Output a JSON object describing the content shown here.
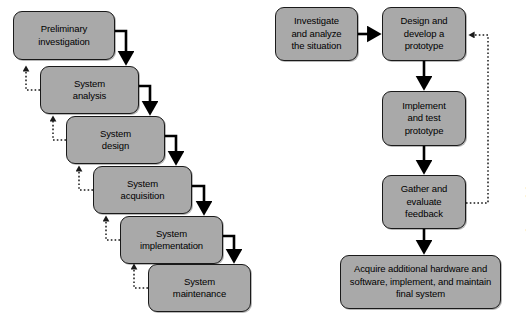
{
  "figure": {
    "credit": "© Cengage Learning",
    "background_color": "#ffffff",
    "node_fill_color": "#a9a9a9",
    "node_border_color": "#1a1a1a",
    "solid_arrow_color": "#000000",
    "dashed_arrow_color": "#3a3a3a"
  },
  "diagrams": [
    {
      "id": "waterfall",
      "name": "traditional-systems-development-life-cycle",
      "nodes": [
        {
          "id": "w1",
          "label": "Preliminary\ninvestigation",
          "line1": "Preliminary",
          "line2": "investigation",
          "x": 13,
          "y": 11,
          "w": 102,
          "h": 49
        },
        {
          "id": "w2",
          "label": "System\nanalysis",
          "line1": "System",
          "line2": "analysis",
          "x": 40,
          "y": 66,
          "w": 99,
          "h": 48
        },
        {
          "id": "w3",
          "label": "System\ndesign",
          "line1": "System",
          "line2": "design",
          "x": 66,
          "y": 116,
          "w": 99,
          "h": 48
        },
        {
          "id": "w4",
          "label": "System\nacquisition",
          "line1": "System",
          "line2": "acquisition",
          "x": 93,
          "y": 166,
          "w": 99,
          "h": 48
        },
        {
          "id": "w5",
          "label": "System\nimplementation",
          "line1": "System",
          "line2": "implementation",
          "x": 120,
          "y": 216,
          "w": 103,
          "h": 48
        },
        {
          "id": "w6",
          "label": "System\nmaintenance",
          "line1": "System",
          "line2": "maintenance",
          "x": 148,
          "y": 264,
          "w": 103,
          "h": 48
        }
      ],
      "forward_arrows": [
        {
          "from": "w1",
          "to": "w2",
          "style": "solid"
        },
        {
          "from": "w2",
          "to": "w3",
          "style": "solid"
        },
        {
          "from": "w3",
          "to": "w4",
          "style": "solid"
        },
        {
          "from": "w4",
          "to": "w5",
          "style": "solid"
        },
        {
          "from": "w5",
          "to": "w6",
          "style": "solid"
        }
      ],
      "feedback_arrows": [
        {
          "from": "w2",
          "to": "w1",
          "style": "dashed"
        },
        {
          "from": "w3",
          "to": "w2",
          "style": "dashed"
        },
        {
          "from": "w4",
          "to": "w3",
          "style": "dashed"
        },
        {
          "from": "w5",
          "to": "w4",
          "style": "dashed"
        },
        {
          "from": "w6",
          "to": "w5",
          "style": "dashed"
        }
      ]
    },
    {
      "id": "prototyping",
      "name": "prototyping-development-process",
      "nodes": [
        {
          "id": "p1",
          "label": "Investigate and analyze the situation",
          "line1": "Investigate",
          "line2": "and analyze",
          "line3": "the situation",
          "x": 275,
          "y": 7,
          "w": 83,
          "h": 54
        },
        {
          "id": "p2",
          "label": "Design and develop a prototype",
          "line1": "Design and",
          "line2": "develop a",
          "line3": "prototype",
          "x": 382,
          "y": 7,
          "w": 84,
          "h": 54
        },
        {
          "id": "p3",
          "label": "Implement and test prototype",
          "line1": "Implement",
          "line2": "and test",
          "line3": "prototype",
          "x": 382,
          "y": 91,
          "w": 84,
          "h": 55
        },
        {
          "id": "p4",
          "label": "Gather and evaluate feedback",
          "line1": "Gather and",
          "line2": "evaluate",
          "line3": "feedback",
          "x": 382,
          "y": 175,
          "w": 84,
          "h": 54
        },
        {
          "id": "p5",
          "label": "Acquire additional hardware and software, implement, and maintain final system",
          "line1": "Acquire additional hardware and",
          "line2": "software, implement, and maintain",
          "line3": "final system",
          "x": 340,
          "y": 255,
          "w": 161,
          "h": 54
        }
      ],
      "forward_arrows": [
        {
          "from": "p1",
          "to": "p2",
          "style": "solid",
          "direction": "right"
        },
        {
          "from": "p2",
          "to": "p3",
          "style": "solid",
          "direction": "down"
        },
        {
          "from": "p3",
          "to": "p4",
          "style": "solid",
          "direction": "down"
        },
        {
          "from": "p4",
          "to": "p5",
          "style": "solid",
          "direction": "down"
        }
      ],
      "feedback_arrows": [
        {
          "from": "p4",
          "to": "p2",
          "style": "dashed",
          "direction": "loop-right"
        }
      ]
    }
  ]
}
